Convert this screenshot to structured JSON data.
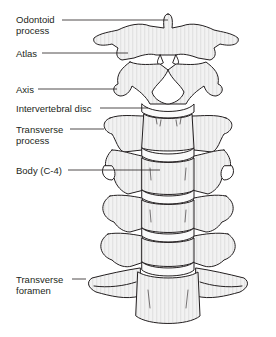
{
  "diagram": {
    "colors": {
      "bone_fill": "#e6e6e6",
      "bone_highlight": "#f7f7f7",
      "outline": "#231f20",
      "background": "#ffffff"
    },
    "labels": [
      {
        "id": "odontoid-process",
        "text": "Odontoid\nprocess",
        "x": 16,
        "y": 19,
        "line_y": 20,
        "line_x1": 62,
        "line_x2": 168
      },
      {
        "id": "atlas",
        "text": "Atlas",
        "x": 16,
        "y": 48,
        "line_y": 53,
        "line_x1": 42,
        "line_x2": 128
      },
      {
        "id": "axis",
        "text": "Axis",
        "x": 16,
        "y": 84,
        "line_y": 89,
        "line_x1": 38,
        "line_x2": 117
      },
      {
        "id": "intervertebral-disc",
        "text": "Intervertebral disc",
        "x": 16,
        "y": 103,
        "line_y": 108,
        "line_x1": 100,
        "line_x2": 140
      },
      {
        "id": "transverse-process",
        "text": "Transverse\nprocess",
        "x": 16,
        "y": 124,
        "line_y": 129,
        "line_x1": 70,
        "line_x2": 104
      },
      {
        "id": "body-c4",
        "text": "Body (C-4)",
        "x": 16,
        "y": 165,
        "line_y": 170,
        "line_x1": 68,
        "line_x2": 140
      },
      {
        "id": "transverse-foramen",
        "text": "Transverse\nforamen",
        "x": 16,
        "y": 272,
        "line_y": 279,
        "line_x1": 72,
        "line_x2": 84
      }
    ]
  }
}
